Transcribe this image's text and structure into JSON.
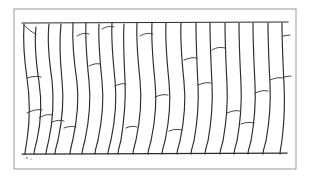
{
  "figure": {
    "caption": "",
    "type": "scientific-line-drawing",
    "background_color": "#ffffff",
    "ink_color": "#2b2b2b",
    "frame_color": "#9a9a9a"
  },
  "frame": {
    "x": 14,
    "y": 9,
    "width": 282,
    "height": 160,
    "stroke": "#9a9a9a",
    "stroke_width": 1
  },
  "tissue": {
    "top_boundary_y": 23,
    "bottom_boundary_y": 154,
    "left_x": 22,
    "right_x": 288,
    "cell_column_count": 19,
    "description": "Vertically elongated cells arranged side by side between an upper and a lower horizontal wall; several columns are subdivided by transverse cross walls."
  },
  "paths": {
    "top_boundary": "M 22 23 L 288 22",
    "bottom_boundary": "M 22 154 L 287 153",
    "verticals": [
      "M 24 24 C 23 40 24 58 27 78 C 30 98 30 120 27 140 C 26 147 25 151 25 154",
      "M 36 27 C 34 45 36 62 39 82 C 42 102 41 122 37 140 C 35 148 34 151 34 154",
      "M 49 24 C 47 42 49 60 52 80 C 54 100 53 120 49 139 C 47 148 46 151 46 154",
      "M 61 24 C 59 42 60 60 62 80 C 64 100 62 122 58 140 C 56 148 55 151 55 154",
      "M 73 23 C 72 42 74 62 77 82 C 79 100 77 120 73 139 C 71 147 70 151 70 154",
      "M 86 23 C 85 42 87 61 89 81 C 91 100 89 121 85 140 C 83 148 82 151 82 154",
      "M 99 24 C 98 42 100 61 102 81 C 104 100 102 121 98 140 C 96 148 95 151 95 154",
      "M 112 23 C 111 42 113 60 115 80 C 117 100 115 121 111 140 C 109 148 108 151 108 154",
      "M 124 24 C 123 42 124 60 125 80 C 126 100 124 121 121 140 C 119 148 118 151 118 154",
      "M 137 23 C 136 42 138 60 140 80 C 142 100 140 121 136 140 C 134 148 133 151 133 154",
      "M 152 23 C 151 42 153 62 155 82 C 157 101 155 122 151 141 C 149 148 148 151 148 154",
      "M 166 23 C 165 42 167 62 169 82 C 171 101 169 122 165 141 C 163 148 162 151 162 154",
      "M 181 23 C 180 42 182 62 184 82 C 186 101 184 122 180 141 C 178 148 177 151 177 154",
      "M 196 23 C 196 44 197 65 198 85 C 199 104 197 124 194 141 C 192 148 191 151 191 154",
      "M 210 23 C 210 43 211 64 212 84 C 213 104 211 124 208 141 C 206 148 205 151 205 154",
      "M 225 23 C 225 43 226 64 227 84 C 228 104 226 124 223 141 C 221 148 220 151 220 154",
      "M 239 23 C 239 43 240 64 241 84 C 242 104 240 124 237 141 C 235 148 234 151 234 154",
      "M 253 23 C 253 43 254 64 255 84 C 256 104 254 124 251 141 C 249 148 248 151 248 154",
      "M 268 23 C 268 43 269 64 270 84 C 271 104 269 124 266 141 C 264 148 263 151 263 154",
      "M 282 23 C 282 43 283 64 284 84 C 285 104 284 124 282 140 C 281 147 280 151 280 154"
    ],
    "cross_walls": [
      "M 24 25 C 29 30 33 33 36 34",
      "M 27 78 C 33 76 38 76 41 77",
      "M 27 113 C 33 110 38 109 42 110",
      "M 39 118 C 44 115 48 114 52 115",
      "M 52 122 C 57 120 61 120 64 121",
      "M 64 128 C 69 126 73 126 76 127",
      "M 77 36 C 82 33 86 33 89 34",
      "M 89 66 C 93 64 97 63 100 64",
      "M 102 29 C 107 26 111 26 114 27",
      "M 115 86 C 119 84 123 83 126 84",
      "M 126 128 C 130 126 134 126 137 127",
      "M 140 36 C 145 33 149 33 153 34",
      "M 155 97 C 160 95 164 94 168 95",
      "M 169 131 C 174 129 178 129 182 130",
      "M 184 60 C 189 58 193 57 197 58",
      "M 198 85 C 203 83 207 82 211 83",
      "M 212 50 C 217 47 221 47 225 48",
      "M 227 113 C 232 111 236 110 240 111",
      "M 241 124 C 246 122 250 122 254 123",
      "M 255 93 C 260 91 264 90 268 91",
      "M 270 80 C 275 78 279 77 283 78"
    ],
    "edge_ticks": [
      "M 283 36 L 290 35",
      "M 284 77 L 291 76"
    ]
  },
  "specks": [
    {
      "x": 27,
      "y": 158,
      "r": 0.9
    },
    {
      "x": 31,
      "y": 159,
      "r": 0.7
    }
  ]
}
